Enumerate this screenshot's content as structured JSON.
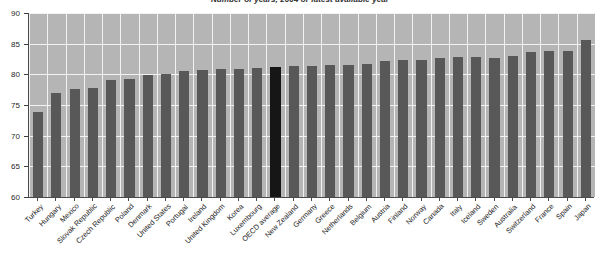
{
  "chart_data": {
    "type": "bar",
    "title": "Number of years, 2004 or latest available year",
    "xlabel": "",
    "ylabel": "",
    "ylim": [
      60,
      90
    ],
    "yticks": [
      60,
      65,
      70,
      75,
      80,
      85,
      90
    ],
    "ytick_labels": [
      "60",
      "65",
      "70",
      "75",
      "80",
      "85",
      "90"
    ],
    "grid": true,
    "legend": "none",
    "bar_color": "#585858",
    "highlight_color": "#161616",
    "plot_background": "#b5b5b5",
    "gridline_color": "#f2f2f2",
    "highlight_category": "OECD average",
    "categories": [
      "Turkey",
      "Hungary",
      "Mexico",
      "Slovak Republic",
      "Czech Republic",
      "Poland",
      "Denmark",
      "United States",
      "Portugal",
      "Ireland",
      "United Kingdom",
      "Korea",
      "Luxembourg",
      "OECD average",
      "New Zealand",
      "Germany",
      "Greece",
      "Netherlands",
      "Belgium",
      "Austria",
      "Finland",
      "Norway",
      "Canada",
      "Italy",
      "Iceland",
      "Sweden",
      "Australia",
      "Switzerland",
      "France",
      "Spain",
      "Japan"
    ],
    "values": [
      73.8,
      76.9,
      77.6,
      77.8,
      79.0,
      79.2,
      79.9,
      80.1,
      80.5,
      80.7,
      80.8,
      80.8,
      81.0,
      81.2,
      81.3,
      81.4,
      81.5,
      81.5,
      81.7,
      82.1,
      82.3,
      82.3,
      82.6,
      82.8,
      82.9,
      82.7,
      83.0,
      83.7,
      83.8,
      83.8,
      85.6
    ]
  }
}
